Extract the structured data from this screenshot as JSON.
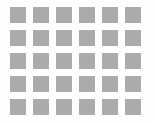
{
  "page": {
    "width": 155,
    "height": 124,
    "background_color": "#fefefe"
  },
  "grid": {
    "name": "square-grid",
    "rows": 5,
    "columns": 6,
    "cell_count": 30,
    "cell": {
      "shape": "square",
      "width": 16,
      "height": 16,
      "fill_color": "#ababab",
      "border": "none",
      "corner_radius": 0
    },
    "spacing": {
      "horizontal_gap": 7,
      "vertical_gap": 7,
      "column_pitch": 23,
      "row_pitch": 23
    },
    "margin": {
      "left": 10,
      "top": 7,
      "right": 7,
      "bottom": 6
    },
    "cells": [
      [
        {
          "row": 1,
          "col": 1,
          "fill": "#ababab"
        },
        {
          "row": 1,
          "col": 2,
          "fill": "#ababab"
        },
        {
          "row": 1,
          "col": 3,
          "fill": "#ababab"
        },
        {
          "row": 1,
          "col": 4,
          "fill": "#ababab"
        },
        {
          "row": 1,
          "col": 5,
          "fill": "#ababab"
        },
        {
          "row": 1,
          "col": 6,
          "fill": "#ababab"
        }
      ],
      [
        {
          "row": 2,
          "col": 1,
          "fill": "#ababab"
        },
        {
          "row": 2,
          "col": 2,
          "fill": "#ababab"
        },
        {
          "row": 2,
          "col": 3,
          "fill": "#ababab"
        },
        {
          "row": 2,
          "col": 4,
          "fill": "#ababab"
        },
        {
          "row": 2,
          "col": 5,
          "fill": "#ababab"
        },
        {
          "row": 2,
          "col": 6,
          "fill": "#ababab"
        }
      ],
      [
        {
          "row": 3,
          "col": 1,
          "fill": "#ababab"
        },
        {
          "row": 3,
          "col": 2,
          "fill": "#ababab"
        },
        {
          "row": 3,
          "col": 3,
          "fill": "#ababab"
        },
        {
          "row": 3,
          "col": 4,
          "fill": "#ababab"
        },
        {
          "row": 3,
          "col": 5,
          "fill": "#ababab"
        },
        {
          "row": 3,
          "col": 6,
          "fill": "#ababab"
        }
      ],
      [
        {
          "row": 4,
          "col": 1,
          "fill": "#ababab"
        },
        {
          "row": 4,
          "col": 2,
          "fill": "#ababab"
        },
        {
          "row": 4,
          "col": 3,
          "fill": "#ababab"
        },
        {
          "row": 4,
          "col": 4,
          "fill": "#ababab"
        },
        {
          "row": 4,
          "col": 5,
          "fill": "#ababab"
        },
        {
          "row": 4,
          "col": 6,
          "fill": "#ababab"
        }
      ],
      [
        {
          "row": 5,
          "col": 1,
          "fill": "#ababab"
        },
        {
          "row": 5,
          "col": 2,
          "fill": "#ababab"
        },
        {
          "row": 5,
          "col": 3,
          "fill": "#ababab"
        },
        {
          "row": 5,
          "col": 4,
          "fill": "#ababab"
        },
        {
          "row": 5,
          "col": 5,
          "fill": "#ababab"
        },
        {
          "row": 5,
          "col": 6,
          "fill": "#ababab"
        }
      ]
    ]
  }
}
